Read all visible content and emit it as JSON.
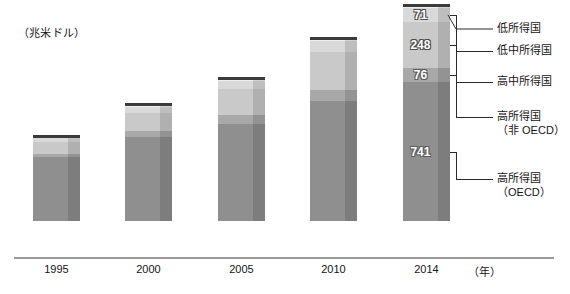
{
  "unit_label": "（兆米ドル）",
  "x_axis_unit": "（年）",
  "colors": {
    "low_income": "#efefef",
    "lower_middle_income": "#d9d9d9",
    "upper_middle_income": "#c9c9c9",
    "high_income_non_oecd": "#a8a8a8",
    "high_income_oecd": "#8f8f8f",
    "bar_cap": "#3b3b3b",
    "axis": "#9a9a9a",
    "text": "#141414"
  },
  "legend": {
    "items": [
      {
        "key": "low_income",
        "label": "低所得国",
        "label2": ""
      },
      {
        "key": "lower_middle_income",
        "label": "低中所得国",
        "label2": ""
      },
      {
        "key": "upper_middle_income",
        "label": "高中所得国",
        "label2": ""
      },
      {
        "key": "high_income_non_oecd",
        "label": "高所得国",
        "label2": "（非 OECD）"
      },
      {
        "key": "high_income_oecd",
        "label": "高所得国",
        "label2": "（OECD）"
      }
    ]
  },
  "x_ticks": [
    "1995",
    "2000",
    "2005",
    "2010",
    "2014"
  ],
  "value_labels_2014": {
    "low_income": "7.2",
    "lower_middle_income": "71",
    "upper_middle_income": "248",
    "high_income_non_oecd": "76",
    "high_income_oecd": "741"
  },
  "chart_data": {
    "type": "bar",
    "subtype": "stacked",
    "title": "",
    "subtitle": "",
    "xlabel": "（年）",
    "ylabel": "（兆米ドル）",
    "grid": false,
    "legend_position": "right",
    "categories": [
      "1995",
      "2000",
      "2005",
      "2010",
      "2014"
    ],
    "series": [
      {
        "name": "高所得国（OECD）",
        "key": "high_income_oecd",
        "color": "#8f8f8f",
        "values": [
          340,
          450,
          520,
          640,
          741
        ],
        "labels": [
          "",
          "",
          "",
          "",
          "741"
        ]
      },
      {
        "name": "高所得国（非 OECD）",
        "key": "high_income_non_oecd",
        "color": "#a8a8a8",
        "values": [
          20,
          32,
          44,
          62,
          76
        ],
        "labels": [
          "",
          "",
          "",
          "",
          "76"
        ]
      },
      {
        "name": "高中所得国",
        "key": "upper_middle_income",
        "color": "#c9c9c9",
        "values": [
          60,
          95,
          140,
          200,
          248
        ],
        "labels": [
          "",
          "",
          "",
          "",
          "248"
        ]
      },
      {
        "name": "低中所得国",
        "key": "lower_middle_income",
        "color": "#d9d9d9",
        "values": [
          22,
          32,
          44,
          58,
          71
        ],
        "labels": [
          "",
          "",
          "",
          "",
          "71"
        ]
      },
      {
        "name": "低所得国",
        "key": "low_income",
        "color": "#efefef",
        "values": [
          2.2,
          3.2,
          4.2,
          5.8,
          7.2
        ],
        "labels": [
          "",
          "",
          "",
          "",
          "7.2"
        ]
      }
    ],
    "totals": [
      444.2,
      612.2,
      752.2,
      965.8,
      1143.2
    ],
    "ylim": [
      0,
      1180
    ],
    "units": "兆米ドル"
  }
}
